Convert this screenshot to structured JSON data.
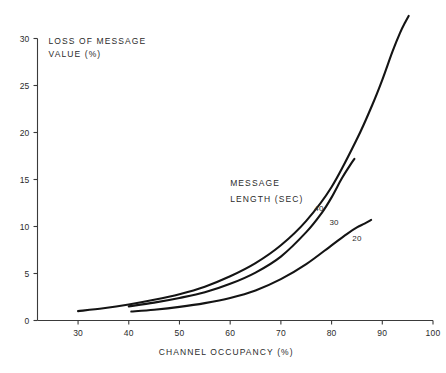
{
  "chart_data": {
    "type": "line",
    "title": "",
    "xlabel": "CHANNEL  OCCUPANCY (%)",
    "ylabel": "LOSS OF MESSAGE VALUE (%)",
    "xlim": [
      22,
      100
    ],
    "ylim": [
      0,
      30
    ],
    "xticks": [
      30,
      40,
      50,
      60,
      70,
      80,
      90,
      100
    ],
    "yticks": [
      0,
      5,
      10,
      15,
      20,
      25,
      30
    ],
    "grid": false,
    "legend_position": "inline-curve-labels",
    "annotations": [
      {
        "text": "MESSAGE",
        "x": 60,
        "y": 14.3
      },
      {
        "text": "LENGTH (SEC)",
        "x": 60,
        "y": 12.6
      }
    ],
    "series": [
      {
        "name": "40",
        "label": "40",
        "label_x": 77.5,
        "label_y": 11.7,
        "x": [
          30,
          35,
          40,
          45,
          50,
          55,
          60,
          65,
          70,
          75,
          80,
          85,
          88,
          90,
          92,
          93.5,
          94.5,
          95.2
        ],
        "y": [
          1.0,
          1.3,
          1.7,
          2.2,
          2.8,
          3.6,
          4.7,
          6.1,
          8.0,
          10.6,
          14.2,
          19.3,
          22.9,
          25.6,
          28.6,
          30.6,
          31.7,
          32.4
        ]
      },
      {
        "name": "30",
        "label": "30",
        "label_x": 80.5,
        "label_y": 10.2,
        "x": [
          40,
          45,
          50,
          55,
          60,
          65,
          70,
          75,
          78,
          80,
          82,
          83.5,
          84.5
        ],
        "y": [
          1.5,
          1.9,
          2.4,
          3.0,
          3.9,
          5.1,
          6.8,
          9.4,
          11.4,
          13.1,
          15.1,
          16.4,
          17.2
        ]
      },
      {
        "name": "20",
        "label": "20",
        "label_x": 85.0,
        "label_y": 8.5,
        "x": [
          40.5,
          45,
          50,
          55,
          60,
          65,
          70,
          75,
          80,
          83,
          85,
          86.5,
          87.8
        ],
        "y": [
          0.95,
          1.15,
          1.45,
          1.85,
          2.4,
          3.2,
          4.4,
          6.0,
          8.0,
          9.2,
          9.9,
          10.3,
          10.7
        ]
      }
    ]
  },
  "axes": {
    "y_axis_title_line1": "LOSS OF MESSAGE",
    "y_axis_title_line2": "VALUE (%)",
    "x_axis_title": "CHANNEL  OCCUPANCY (%)",
    "ytick_labels": [
      "0",
      "5",
      "10",
      "15",
      "20",
      "25",
      "30"
    ],
    "xtick_labels": [
      "30",
      "40",
      "50",
      "60",
      "70",
      "80",
      "90",
      "100"
    ]
  },
  "annotation": {
    "line1": "MESSAGE",
    "line2": "LENGTH (SEC)"
  },
  "curve_labels": {
    "s40": "40",
    "s30": "30",
    "s20": "20"
  },
  "colors": {
    "background": "#ffffff",
    "curve": "#141414",
    "axis": "#3a3a3a",
    "text": "#2b2b2b"
  }
}
